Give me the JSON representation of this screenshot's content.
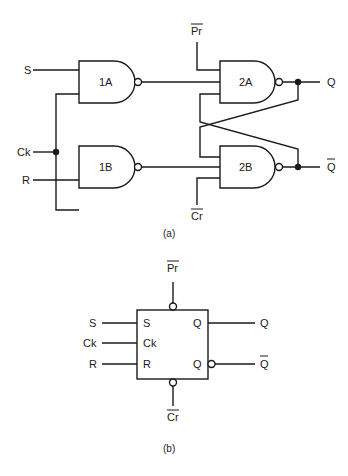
{
  "figure_a": {
    "caption": "(a)",
    "inputs": {
      "s": "S",
      "ck": "Ck",
      "r": "R",
      "pr": "Pr",
      "cr": "Cr"
    },
    "outputs": {
      "q": "Q",
      "qbar": "Q"
    },
    "gates": [
      {
        "id": "1A",
        "type": "NAND"
      },
      {
        "id": "1B",
        "type": "NAND"
      },
      {
        "id": "2A",
        "type": "NAND"
      },
      {
        "id": "2B",
        "type": "NAND"
      }
    ]
  },
  "figure_b": {
    "caption": "(b)",
    "external_inputs": {
      "s": "S",
      "ck": "Ck",
      "r": "R",
      "pr": "Pr",
      "cr": "Cr"
    },
    "external_outputs": {
      "q": "Q",
      "qbar": "Q"
    },
    "pins": {
      "s": "S",
      "ck": "Ck",
      "r": "R",
      "q": "Q",
      "qbar": "Q"
    }
  }
}
